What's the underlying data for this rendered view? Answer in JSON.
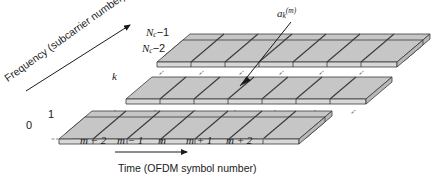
{
  "figure": {
    "type": "ofdm-time-frequency-grid",
    "axes": {
      "frequency_title": "Frequency (subcarrier number)",
      "time_title": "Time (OFDM symbol number)"
    },
    "frequency_ticks": [
      {
        "id": "nc-minus-1",
        "base": "N",
        "sub": "c",
        "op": "−1"
      },
      {
        "id": "nc-minus-2",
        "base": "N",
        "sub": "c",
        "op": "−2"
      },
      {
        "id": "k",
        "base": "k",
        "sub": "",
        "op": ""
      },
      {
        "id": "one",
        "base": "1",
        "sub": "",
        "op": ""
      },
      {
        "id": "zero",
        "base": "0",
        "sub": "",
        "op": ""
      }
    ],
    "time_ticks": [
      {
        "id": "m-minus-2",
        "text": "m − 2"
      },
      {
        "id": "m-minus-1",
        "text": "m − 1"
      },
      {
        "id": "m",
        "text": "m"
      },
      {
        "id": "m-plus-1",
        "text": "m + 1"
      },
      {
        "id": "m-plus-2",
        "text": "m + 2"
      }
    ],
    "annotation": {
      "symbol_base": "a",
      "symbol_sub": "k",
      "symbol_sup": "(m)"
    },
    "colors": {
      "cell_top_face": "#c6c6c6",
      "cell_front_face": "#d8d8d8",
      "cell_side_face": "#b8b8b8",
      "outline": "#3a3a3a",
      "text": "#1a1a1a",
      "dash": "#8a8a8a",
      "background": "#ffffff"
    },
    "plane_groups": [
      {
        "id": "top-group",
        "rows": 2,
        "label_rows": [
          "N_c-1",
          "N_c-2"
        ]
      },
      {
        "id": "middle-group",
        "rows": 1,
        "label_rows": [
          "k"
        ]
      },
      {
        "id": "bottom-group",
        "rows": 2,
        "label_rows": [
          "1",
          "0"
        ]
      }
    ],
    "columns": 7,
    "ellipsis_text": "· · · · ·"
  }
}
